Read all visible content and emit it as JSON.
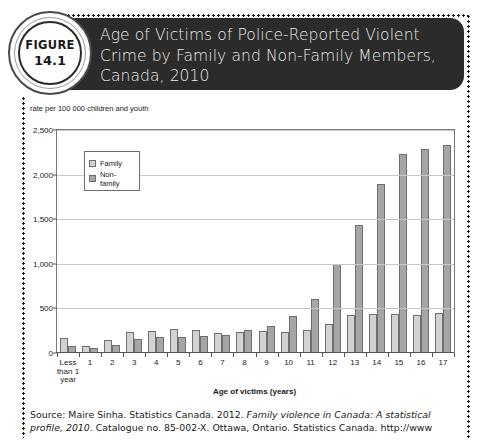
{
  "figure": {
    "badge_word": "FIGURE",
    "badge_number": "14.1",
    "title": "Age of Victims of Police-Reported Violent Crime by Family and Non-Family Members, Canada, 2010"
  },
  "source": {
    "prefix": "Source: Maire Sinha. Statistics Canada. 2012. ",
    "italic": "Family violence in Canada: A statistical profile, 2010",
    "suffix": ". Catalogue no. 85-002-X. Ottawa, Ontario. Statistics Canada. http://www"
  },
  "colors": {
    "banner": "#2b2b2b",
    "family": "#d2d2d2",
    "nonfamily": "#a6a6a6",
    "gridline": "#c8c8c8",
    "axis": "#555555"
  },
  "chart_data": {
    "type": "bar",
    "title": "Age of Victims of Police-Reported Violent Crime by Family and Non-Family Members, Canada, 2010",
    "subtitle": "",
    "xlabel": "Age of victims (years)",
    "ylabel": "rate per 100 000 children and youth",
    "ylim": [
      0,
      2500
    ],
    "yticks": [
      0,
      500,
      1000,
      1500,
      2000,
      2500
    ],
    "ytick_labels": [
      "0",
      "500",
      "1,000",
      "1,500",
      "2,000",
      "2,500"
    ],
    "grid": true,
    "legend_position": "upper-left-inside",
    "categories": [
      "Less than 1 year",
      "1",
      "2",
      "3",
      "4",
      "5",
      "6",
      "7",
      "8",
      "9",
      "10",
      "11",
      "12",
      "13",
      "14",
      "15",
      "16",
      "17"
    ],
    "series": [
      {
        "name": "Family",
        "values": [
          170,
          75,
          150,
          230,
          250,
          265,
          255,
          225,
          230,
          245,
          230,
          260,
          320,
          430,
          440,
          440,
          430,
          445
        ]
      },
      {
        "name": "Non-family",
        "values": [
          80,
          55,
          85,
          155,
          175,
          175,
          190,
          205,
          260,
          300,
          410,
          600,
          1000,
          1430,
          1900,
          2230,
          2290,
          2330
        ]
      }
    ]
  }
}
